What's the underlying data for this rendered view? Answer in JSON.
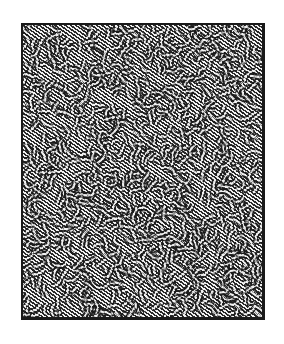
{
  "artwork": {
    "description": "Dense hand-drawn pattern of wavy black ink lines on white paper, enclosed in a rectangular black border",
    "frame": {
      "x": 21,
      "y": 23,
      "width": 244,
      "height": 297
    },
    "colors": {
      "background": "#ffffff",
      "ink": "#1a1a1a",
      "paper": "#f2f2f2"
    },
    "texture": {
      "stroke_count": 1400,
      "seed": 7,
      "stroke_width": 1.1,
      "segment_length": [
        6,
        14
      ]
    }
  }
}
